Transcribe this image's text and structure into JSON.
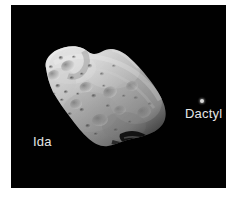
{
  "image": {
    "panel_background_color": "#000000",
    "page_background_color": "#ffffff",
    "label_color": "#e6e6e6"
  },
  "labels": {
    "ida": "Ida",
    "dactyl": "Dactyl"
  },
  "objects": {
    "asteroid": {
      "name": "Ida",
      "surface_color_light": "#d9d9d9",
      "surface_color_mid": "#9e9e9e",
      "surface_color_dark": "#3a3a3a"
    },
    "moon": {
      "name": "Dactyl",
      "dot_color": "#d8d8d8"
    }
  }
}
